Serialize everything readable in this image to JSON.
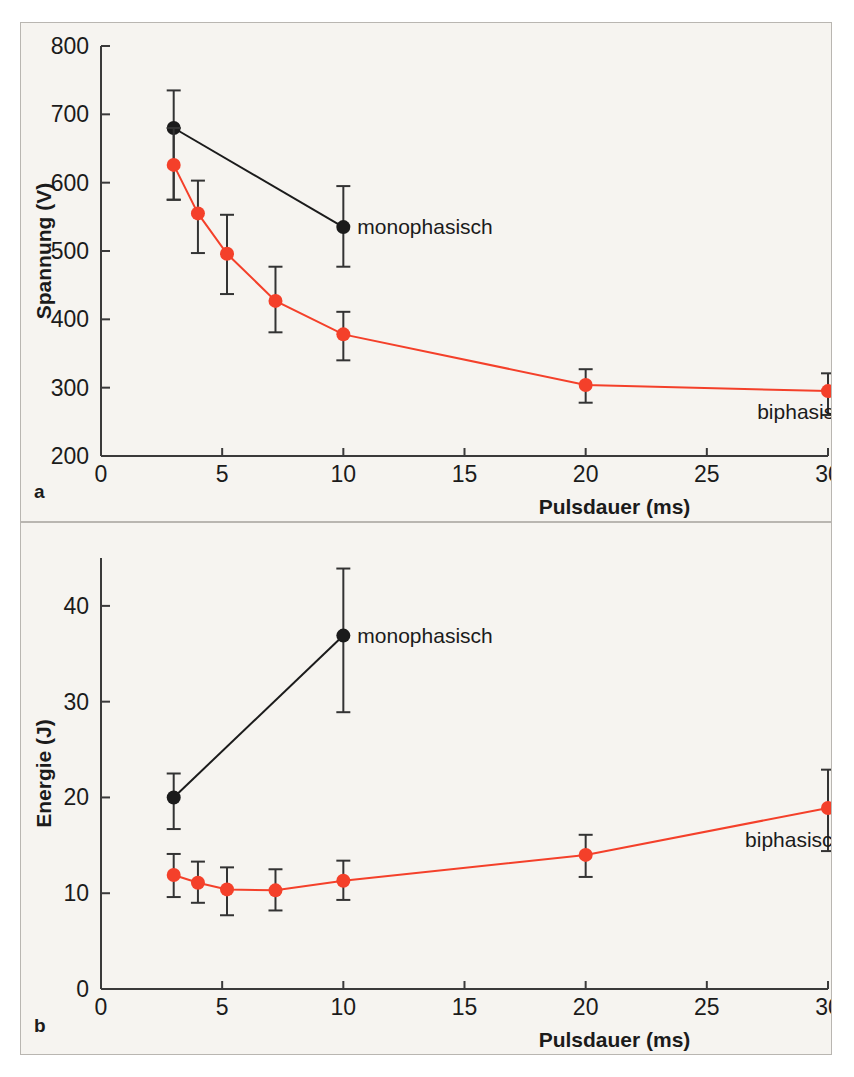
{
  "figure": {
    "background": "#f6f4f0",
    "border_color": "#b9b6b1",
    "panels": [
      {
        "letter": "a"
      },
      {
        "letter": "b"
      }
    ]
  },
  "colors": {
    "monophasic": "#1b1b1b",
    "biphasic": "#f4402a",
    "axis": "#3a3a3a",
    "text": "#1b1b1b"
  },
  "chart_data": [
    {
      "type": "line",
      "panel": "a",
      "title": "",
      "xlabel": "Pulsdauer (ms)",
      "ylabel": "Spannung (V)",
      "xlim": [
        0,
        30
      ],
      "ylim": [
        200,
        800
      ],
      "xticks": [
        0,
        5,
        10,
        15,
        20,
        25,
        30
      ],
      "xticklabels": [
        "0",
        "5",
        "10",
        "15",
        "20",
        "25",
        "30"
      ],
      "yticks": [
        200,
        300,
        400,
        500,
        600,
        700,
        800
      ],
      "yticklabels": [
        "200",
        "300",
        "400",
        "500",
        "600",
        "700",
        "800"
      ],
      "grid": false,
      "legend_position": "inline-annotation",
      "series": [
        {
          "name": "monophasisch",
          "color": "#1b1b1b",
          "label_anchor": {
            "x": 10,
            "y": 535
          },
          "x": [
            3,
            10
          ],
          "values": [
            680,
            535
          ],
          "err_low": [
            105,
            58
          ],
          "err_high": [
            55,
            60
          ]
        },
        {
          "name": "biphasisch",
          "color": "#f4402a",
          "label_anchor": {
            "x": 26.5,
            "y": 265
          },
          "x": [
            3,
            4,
            5.2,
            7.2,
            10,
            20,
            30
          ],
          "values": [
            626,
            555,
            496,
            427,
            378,
            304,
            295
          ],
          "err_low": [
            51,
            58,
            59,
            46,
            38,
            26,
            35
          ],
          "err_high": [
            54,
            48,
            57,
            50,
            33,
            23,
            26
          ]
        }
      ]
    },
    {
      "type": "line",
      "panel": "b",
      "title": "",
      "xlabel": "Pulsdauer (ms)",
      "ylabel": "Energie (J)",
      "xlim": [
        0,
        30
      ],
      "ylim": [
        0,
        45
      ],
      "xticks": [
        0,
        5,
        10,
        15,
        20,
        25,
        30
      ],
      "xticklabels": [
        "0",
        "5",
        "10",
        "15",
        "20",
        "25",
        "30"
      ],
      "yticks": [
        0,
        10,
        20,
        30,
        40
      ],
      "yticklabels": [
        "0",
        "10",
        "20",
        "30",
        "40"
      ],
      "grid": false,
      "legend_position": "inline-annotation",
      "series": [
        {
          "name": "monophasisch",
          "color": "#1b1b1b",
          "label_anchor": {
            "x": 10,
            "y": 36.9
          },
          "x": [
            3,
            10
          ],
          "values": [
            20.0,
            36.9
          ],
          "err_low": [
            3.3,
            8.0
          ],
          "err_high": [
            2.5,
            7.0
          ]
        },
        {
          "name": "biphasisch",
          "color": "#f4402a",
          "label_anchor": {
            "x": 26.0,
            "y": 15.6
          },
          "x": [
            3,
            4,
            5.2,
            7.2,
            10,
            20,
            30
          ],
          "values": [
            11.9,
            11.1,
            10.4,
            10.3,
            11.3,
            14.0,
            18.9
          ],
          "err_low": [
            2.3,
            2.1,
            2.7,
            2.1,
            2.0,
            2.3,
            4.5
          ],
          "err_high": [
            2.2,
            2.2,
            2.3,
            2.2,
            2.1,
            2.1,
            4.0
          ]
        }
      ]
    }
  ]
}
